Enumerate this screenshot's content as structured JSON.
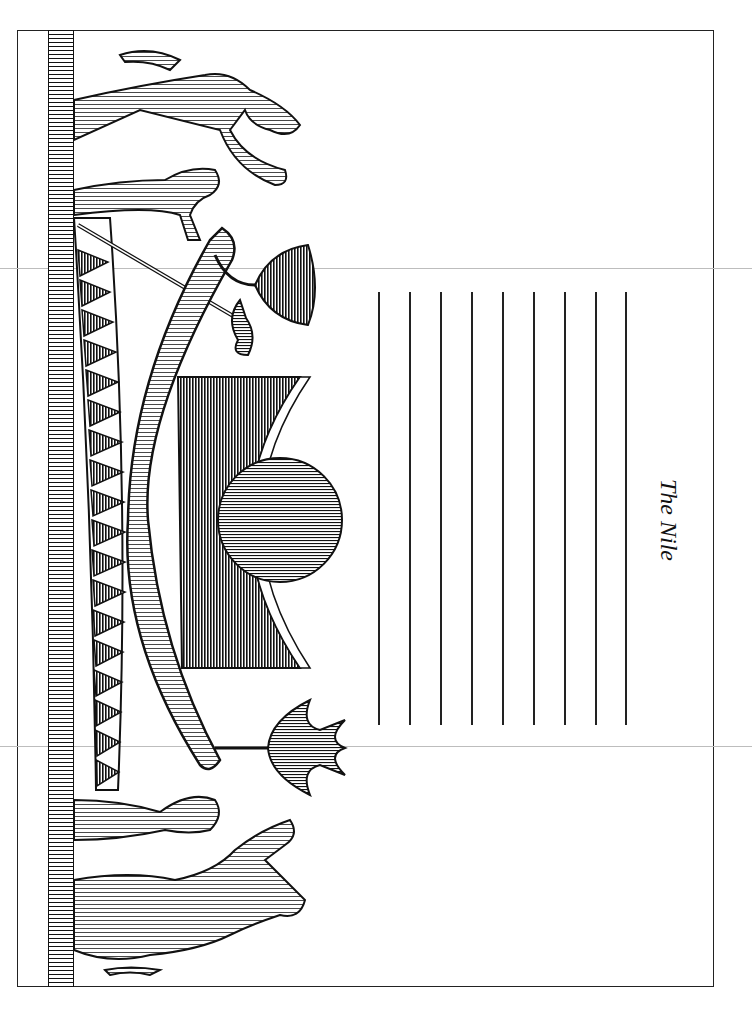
{
  "page": {
    "title": "The Nile",
    "orientation": "rotated-90-clockwise",
    "writing_lines_count": 9
  },
  "illustration": {
    "subject": "Egyptian solar barque with sun disk, lotus flower, and baboon figures",
    "elements": [
      "ground-band",
      "zigzag-triangle-band",
      "solar-barque",
      "crescent-shrine",
      "sun-disk",
      "lotus-flower",
      "bell-flower",
      "baboon-top-large",
      "baboon-top-small",
      "baboon-bottom-small",
      "baboon-bottom-large"
    ]
  },
  "colors": {
    "ink": "#111111",
    "paper": "#ffffff",
    "fold_line": "#bdbdbd"
  }
}
